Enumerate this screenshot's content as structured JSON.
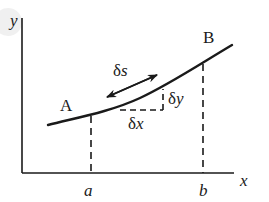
{
  "diagram": {
    "type": "arc-length-element",
    "axes": {
      "x_label": "x",
      "y_label": "y",
      "x_ticks": [
        {
          "label": "a"
        },
        {
          "label": "b"
        }
      ]
    },
    "curve": {
      "start_point_label": "A",
      "end_point_label": "B"
    },
    "element": {
      "arc_label_delta": "δ",
      "arc_label_var": "s",
      "dx_label_delta": "δ",
      "dx_label_var": "x",
      "dy_label_delta": "δ",
      "dy_label_var": "y"
    },
    "colors": {
      "ink": "#1a1a1a",
      "background": "#ffffff"
    }
  }
}
